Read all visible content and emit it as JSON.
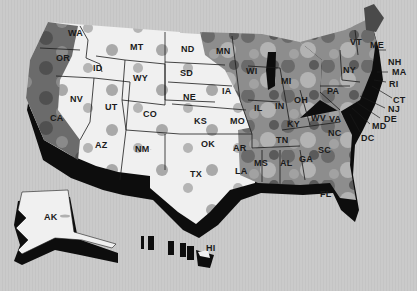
{
  "map": {
    "type": "choropleth",
    "region": "United States",
    "style": "3D extruded grayscale",
    "colors": {
      "background": "#c9c9c9",
      "level_low": "#efefef",
      "level_mid": "#9a9a9a",
      "level_high": "#6e6e6e",
      "level_max": "#4a4a4a",
      "extrusion": "#0d0d0d"
    },
    "states": {
      "WA": "WA",
      "OR": "OR",
      "CA": "CA",
      "ID": "ID",
      "NV": "NV",
      "MT": "MT",
      "WY": "WY",
      "UT": "UT",
      "AZ": "AZ",
      "CO": "CO",
      "NM": "NM",
      "ND": "ND",
      "SD": "SD",
      "NE": "NE",
      "KS": "KS",
      "OK": "OK",
      "TX": "TX",
      "MN": "MN",
      "IA": "IA",
      "MO": "MO",
      "AR": "AR",
      "LA": "LA",
      "WI": "WI",
      "IL": "IL",
      "MI": "MI",
      "IN": "IN",
      "OH": "OH",
      "KY": "KY",
      "TN": "TN",
      "MS": "MS",
      "AL": "AL",
      "GA": "GA",
      "FL": "FL",
      "SC": "SC",
      "NC": "NC",
      "VA": "VA",
      "WV": "WV",
      "PA": "PA",
      "NY": "NY",
      "VT": "VT",
      "ME": "ME",
      "NH": "NH",
      "MA": "MA",
      "RI": "RI",
      "CT": "CT",
      "NJ": "NJ",
      "DE": "DE",
      "MD": "MD",
      "DC": "DC",
      "AK": "AK",
      "HI": "HI"
    }
  }
}
